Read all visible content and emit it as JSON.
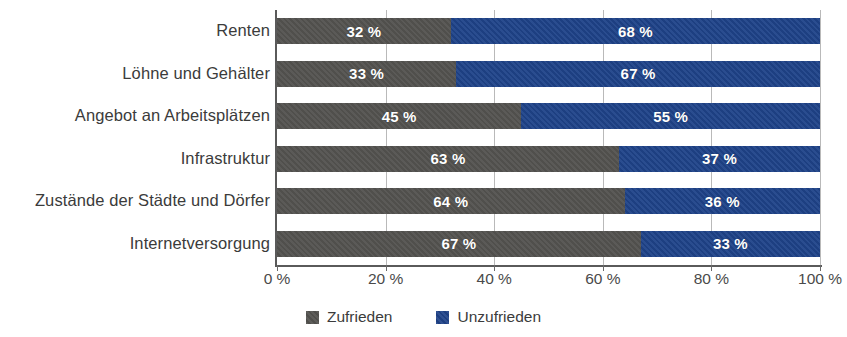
{
  "chart_data": {
    "type": "bar",
    "orientation": "horizontal",
    "stacked": true,
    "normalized": true,
    "title": "",
    "subtitle": "",
    "xlabel": "",
    "ylabel": "",
    "xlim": [
      0,
      100
    ],
    "xticks": [
      0,
      20,
      40,
      60,
      80,
      100
    ],
    "xtick_labels": [
      "0 %",
      "20 %",
      "40 %",
      "60 %",
      "80 %",
      "100 %"
    ],
    "grid": true,
    "grid_axis": "x",
    "legend_position": "bottom-center",
    "categories": [
      "Renten",
      "Löhne und Gehälter",
      "Angebot an Arbeitsplätzen",
      "Infrastruktur",
      "Zustände der Städte und Dörfer",
      "Internetversorgung"
    ],
    "series": [
      {
        "name": "Zufrieden",
        "color": "#545350",
        "values": [
          32,
          33,
          45,
          63,
          64,
          67
        ],
        "labels": [
          "32 %",
          "33 %",
          "45 %",
          "63 %",
          "64 %",
          "67 %"
        ]
      },
      {
        "name": "Unzufrieden",
        "color": "#1f4389",
        "values": [
          68,
          67,
          55,
          37,
          36,
          33
        ],
        "labels": [
          "68 %",
          "67 %",
          "55 %",
          "37 %",
          "36 %",
          "33 %"
        ]
      }
    ]
  },
  "legend": {
    "items": [
      {
        "label": "Zufrieden",
        "swatch": "satisfied-swatch"
      },
      {
        "label": "Unzufrieden",
        "swatch": "unsatisfied-swatch"
      }
    ]
  },
  "colors": {
    "satisfied": "#545350",
    "unsatisfied": "#1f4389",
    "axis": "#5a5a5a",
    "grid": "#b9b9b9",
    "text": "#3b3b3b",
    "value_text": "#ffffff",
    "background": "#ffffff"
  }
}
